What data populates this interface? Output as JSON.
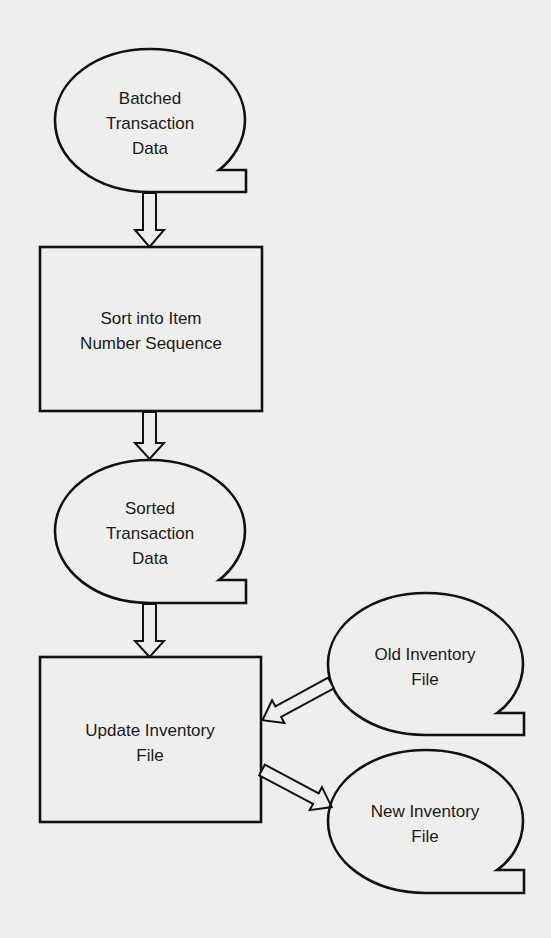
{
  "diagram": {
    "type": "system-flowchart",
    "background": "#eeeeec",
    "stroke_color": "#111111",
    "nodes": [
      {
        "id": "batched",
        "shape": "stored-data",
        "lines": [
          "Batched",
          "Transaction",
          "Data"
        ]
      },
      {
        "id": "sort",
        "shape": "process",
        "lines": [
          "Sort into Item",
          "Number Sequence"
        ]
      },
      {
        "id": "sorted",
        "shape": "stored-data",
        "lines": [
          "Sorted",
          "Transaction",
          "Data"
        ]
      },
      {
        "id": "update",
        "shape": "process",
        "lines": [
          "Update Inventory",
          "File"
        ]
      },
      {
        "id": "old",
        "shape": "stored-data",
        "lines": [
          "Old Inventory",
          "File"
        ]
      },
      {
        "id": "new",
        "shape": "stored-data",
        "lines": [
          "New Inventory",
          "File"
        ]
      }
    ],
    "edges": [
      {
        "from": "batched",
        "to": "sort"
      },
      {
        "from": "sort",
        "to": "sorted"
      },
      {
        "from": "sorted",
        "to": "update"
      },
      {
        "from": "old",
        "to": "update"
      },
      {
        "from": "update",
        "to": "new"
      }
    ]
  }
}
